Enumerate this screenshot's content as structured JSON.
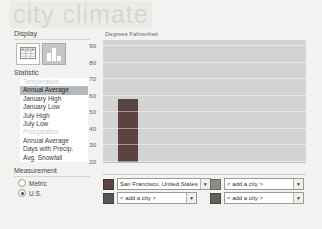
{
  "title": "city climate",
  "sidebar": {
    "display": {
      "label": "Display"
    },
    "statistic": {
      "label": "Statistic",
      "items": [
        {
          "label": "Temperature",
          "type": "header"
        },
        {
          "label": "Annual Average",
          "type": "item",
          "selected": true
        },
        {
          "label": "January High",
          "type": "item"
        },
        {
          "label": "January Low",
          "type": "item"
        },
        {
          "label": "July High",
          "type": "item"
        },
        {
          "label": "July Low",
          "type": "item"
        },
        {
          "label": "Precipitation",
          "type": "header"
        },
        {
          "label": "Annual Average",
          "type": "item"
        },
        {
          "label": "Days with Precip.",
          "type": "item"
        },
        {
          "label": "Avg. Snowfall",
          "type": "item"
        }
      ]
    },
    "measurement": {
      "label": "Measurement",
      "options": [
        {
          "label": "Metric",
          "selected": false
        },
        {
          "label": "U.S.",
          "selected": true
        }
      ]
    }
  },
  "chart_data": {
    "type": "bar",
    "title": "Degrees Fahrenheit",
    "ylabel": "Degrees Fahrenheit",
    "statistic_shown": "Annual Average Temperature",
    "ylim": [
      20,
      90
    ],
    "yticks": [
      90,
      80,
      70,
      60,
      50,
      40,
      30,
      20
    ],
    "grid": true,
    "categories": [
      "San Francisco, United States"
    ],
    "series": [
      {
        "name": "San Francisco, United States",
        "values": [
          58
        ],
        "color": "#5a4341"
      }
    ],
    "legend_position": "none"
  },
  "city_selectors": [
    {
      "value": "San Francisco, United States",
      "swatch": "#5a4341"
    },
    {
      "value": "< add a city >",
      "swatch": "#87907f"
    },
    {
      "value": "< add a city >",
      "swatch": "#53565a"
    },
    {
      "value": "< add a city >",
      "swatch": "#5d6655"
    }
  ],
  "colors": {
    "plot_background": "#d3d3d1",
    "selected_statistic_bg": "#b4b9bd",
    "title_color": "#d7d7d3"
  }
}
